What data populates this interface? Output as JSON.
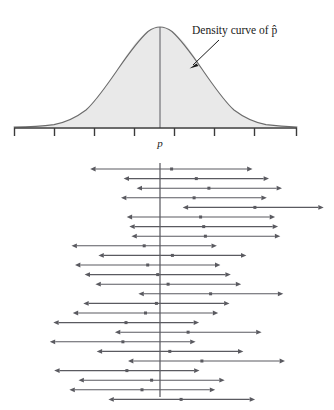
{
  "figure": {
    "title_label": "Density curve of p̂",
    "center_label": "p",
    "background_color": "#ffffff",
    "curve_stroke_color": "#6b6b6b",
    "curve_fill_color": "#e9e9e9",
    "axis_color": "#3a3a3a",
    "interval_color": "#5a5a60",
    "center_line_color": "#55555c",
    "annotation_color": "#1a1a1a"
  },
  "chart_data": [
    {
      "type": "area",
      "title": "Density curve of p̂",
      "subtitle": "",
      "xlabel": "",
      "ylabel": "",
      "grid": false,
      "legend": "none",
      "annotations": [
        {
          "text": "Density curve of p̂",
          "target_x": 0.78,
          "target_y": 0.42,
          "label_x": 1.45,
          "label_y": 0.95
        }
      ],
      "axis": {
        "x_min": -3.65,
        "x_max": 3.4,
        "tick_positions": [
          -3.65,
          -2.65,
          -1.65,
          -0.65,
          0.35,
          1.35,
          2.35,
          3.35
        ],
        "tick_labels": [
          "",
          "",
          "",
          "",
          "",
          "",
          "",
          ""
        ],
        "center_tick_label": "p",
        "center_tick_position": 0.0
      },
      "series": [
        {
          "name": "normal density",
          "distribution": "normal",
          "mean": 0.0,
          "sd": 1.0,
          "x": [
            -3.6,
            -3.2,
            -2.8,
            -2.4,
            -2.0,
            -1.6,
            -1.2,
            -0.8,
            -0.4,
            0.0,
            0.4,
            0.8,
            1.2,
            1.6,
            2.0,
            2.4,
            2.8,
            3.2
          ],
          "values": [
            0.0006,
            0.0024,
            0.0079,
            0.0224,
            0.054,
            0.1109,
            0.1942,
            0.2897,
            0.3683,
            0.3989,
            0.3683,
            0.2897,
            0.1942,
            0.1109,
            0.054,
            0.0224,
            0.0079,
            0.0024
          ]
        }
      ],
      "vertical_reference_line": {
        "x": 0.0,
        "label": "p"
      }
    },
    {
      "type": "line",
      "title": "",
      "subtitle": "",
      "xlabel": "",
      "ylabel": "",
      "grid": false,
      "legend": "none",
      "description": "Twenty-four confidence intervals for p; each interval drawn as a horizontal segment with arrow endpoints and a center dot at the sample estimate p-hat. One interval (number 5) lies entirely to the right of p and therefore fails to capture p.",
      "xlim": [
        -3.65,
        3.4
      ],
      "vertical_reference_line": {
        "x": 0.0,
        "label": "p"
      },
      "interval_count": 24,
      "misses_count": 1,
      "categories": [
        1,
        2,
        3,
        4,
        5,
        6,
        7,
        8,
        9,
        10,
        11,
        12,
        13,
        14,
        15,
        16,
        17,
        18,
        19,
        20,
        21,
        22,
        23,
        24
      ],
      "intervals": [
        {
          "index": 1,
          "lower": -1.77,
          "center": -0.02,
          "upper": 1.72,
          "captures": true
        },
        {
          "index": 2,
          "lower": -1.0,
          "center": 0.55,
          "upper": 2.1,
          "captures": true
        },
        {
          "index": 3,
          "lower": -0.7,
          "center": 0.84,
          "upper": 2.4,
          "captures": true
        },
        {
          "index": 4,
          "lower": -1.06,
          "center": 0.5,
          "upper": 2.05,
          "captures": true
        },
        {
          "index": 5,
          "lower": 0.36,
          "center": 1.9,
          "upper": 3.36,
          "captures": false
        },
        {
          "index": 6,
          "lower": -0.93,
          "center": 0.65,
          "upper": 2.24,
          "captures": true
        },
        {
          "index": 7,
          "lower": -0.87,
          "center": 0.72,
          "upper": 2.31,
          "captures": true
        },
        {
          "index": 8,
          "lower": -0.82,
          "center": 0.76,
          "upper": 2.36,
          "captures": true
        },
        {
          "index": 9,
          "lower": -2.2,
          "center": -0.65,
          "upper": 0.9,
          "captures": true
        },
        {
          "index": 10,
          "lower": -1.58,
          "center": 0.0,
          "upper": 1.58,
          "captures": true
        },
        {
          "index": 11,
          "lower": -2.12,
          "center": -0.57,
          "upper": 0.98,
          "captures": true
        },
        {
          "index": 12,
          "lower": -1.9,
          "center": -0.34,
          "upper": 1.22,
          "captures": true
        },
        {
          "index": 13,
          "lower": -1.65,
          "center": -0.1,
          "upper": 1.46,
          "captures": true
        },
        {
          "index": 14,
          "lower": -0.66,
          "center": 0.88,
          "upper": 2.43,
          "captures": true
        },
        {
          "index": 15,
          "lower": -1.93,
          "center": -0.37,
          "upper": 1.19,
          "captures": true
        },
        {
          "index": 16,
          "lower": -2.17,
          "center": -0.62,
          "upper": 0.93,
          "captures": true
        },
        {
          "index": 17,
          "lower": -2.62,
          "center": -1.07,
          "upper": 0.49,
          "captures": true
        },
        {
          "index": 18,
          "lower": -1.2,
          "center": 0.36,
          "upper": 1.93,
          "captures": true
        },
        {
          "index": 19,
          "lower": -2.7,
          "center": -1.14,
          "upper": 0.41,
          "captures": true
        },
        {
          "index": 20,
          "lower": -1.62,
          "center": -0.06,
          "upper": 1.51,
          "captures": true
        },
        {
          "index": 21,
          "lower": -0.9,
          "center": 0.68,
          "upper": 2.47,
          "captures": true
        },
        {
          "index": 22,
          "lower": -2.6,
          "center": -1.05,
          "upper": 0.5,
          "captures": true
        },
        {
          "index": 23,
          "lower": -2.04,
          "center": -0.48,
          "upper": 1.08,
          "captures": true
        },
        {
          "index": 24,
          "lower": -2.25,
          "center": -0.7,
          "upper": 0.86,
          "captures": true
        },
        {
          "index": 25,
          "lower": -1.35,
          "center": 0.2,
          "upper": 1.78,
          "captures": true
        }
      ]
    }
  ]
}
